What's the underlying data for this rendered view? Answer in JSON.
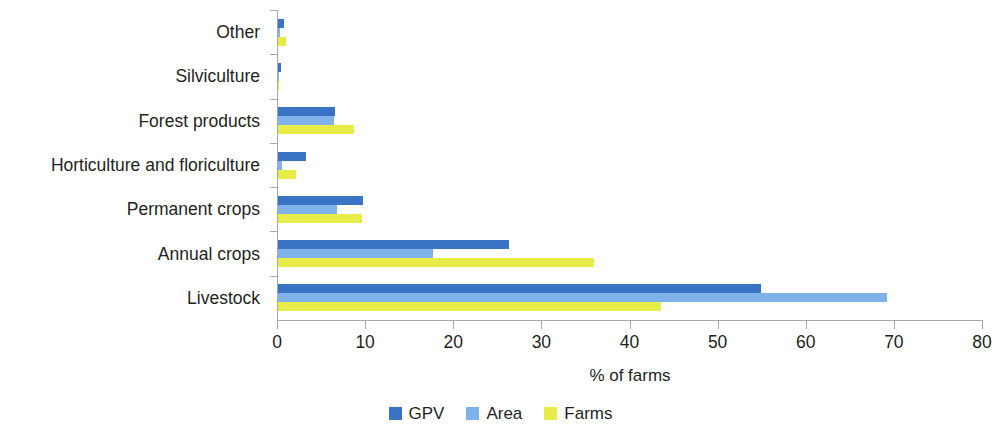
{
  "chart_data": {
    "type": "bar",
    "orientation": "horizontal",
    "title": "",
    "xlabel": "% of farms",
    "ylabel": "",
    "xlim": [
      0,
      80
    ],
    "xticks": [
      0,
      10,
      20,
      30,
      40,
      50,
      60,
      70,
      80
    ],
    "grid": false,
    "legend_position": "bottom-center",
    "categories": [
      "Other",
      "Silviculture",
      "Forest products",
      "Horticulture and floriculture",
      "Permanent crops",
      "Annual crops",
      "Livestock"
    ],
    "series": [
      {
        "name": "GPV",
        "color": "#3a72c4",
        "values": [
          0.7,
          0.35,
          6.5,
          3.2,
          9.6,
          26.2,
          54.8
        ]
      },
      {
        "name": "Area",
        "color": "#7eb2e8",
        "values": [
          0.2,
          0.1,
          6.4,
          0.4,
          6.7,
          17.6,
          69.1
        ]
      },
      {
        "name": "Farms",
        "color": "#e8ec49",
        "values": [
          0.9,
          0.15,
          8.6,
          2.0,
          9.5,
          35.9,
          43.5
        ]
      }
    ]
  },
  "axis": {
    "x_title": "% of farms",
    "tick_labels": [
      "0",
      "10",
      "20",
      "30",
      "40",
      "50",
      "60",
      "70",
      "80"
    ]
  },
  "legend": {
    "items": [
      {
        "label": "GPV",
        "color": "#3a72c4"
      },
      {
        "label": "Area",
        "color": "#7eb2e8"
      },
      {
        "label": "Farms",
        "color": "#e8ec49"
      }
    ]
  },
  "colors": {
    "gpv": "#3a72c4",
    "area": "#7eb2e8",
    "farms": "#e8ec49",
    "axis": "#a8a8a8",
    "text": "#231f20",
    "background": "#ffffff"
  }
}
